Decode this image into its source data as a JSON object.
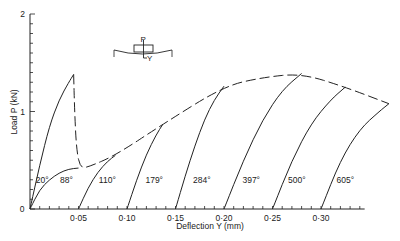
{
  "chart_data": {
    "type": "line",
    "title": "",
    "xlabel": "Deflection Y (mm)",
    "ylabel": "Load P (kN)",
    "xlim": [
      0,
      0.37
    ],
    "ylim": [
      0,
      2
    ],
    "x_ticks": [
      "0",
      "0·05",
      "0·10",
      "0·15",
      "0·20",
      "0·25",
      "0·30"
    ],
    "x_tick_values": [
      0,
      0.05,
      0.1,
      0.15,
      0.2,
      0.25,
      0.3
    ],
    "y_ticks": [
      "0",
      "1",
      "2"
    ],
    "y_tick_values": [
      0,
      1,
      2
    ],
    "grid": false,
    "legend": "none",
    "inset_diagram": {
      "labels": [
        "P",
        "Y"
      ],
      "description": "simply supported beam with central load P and deflection Y"
    },
    "series": [
      {
        "name": "20°",
        "style": "solid",
        "x": [
          0,
          0.01,
          0.02,
          0.03,
          0.04,
          0.045
        ],
        "y": [
          0,
          0.45,
          0.85,
          1.12,
          1.3,
          1.38
        ]
      },
      {
        "name": "88°",
        "style": "solid",
        "x": [
          0,
          0.01,
          0.02,
          0.03,
          0.04,
          0.05
        ],
        "y": [
          0,
          0.2,
          0.3,
          0.37,
          0.41,
          0.42
        ]
      },
      {
        "name": "110°",
        "style": "solid",
        "x": [
          0.05,
          0.06,
          0.07,
          0.08,
          0.088
        ],
        "y": [
          0,
          0.22,
          0.38,
          0.49,
          0.55
        ]
      },
      {
        "name": "179°",
        "style": "solid",
        "x": [
          0.1,
          0.11,
          0.12,
          0.13,
          0.137
        ],
        "y": [
          0,
          0.3,
          0.56,
          0.76,
          0.87
        ]
      },
      {
        "name": "284°",
        "style": "solid",
        "x": [
          0.15,
          0.16,
          0.17,
          0.18,
          0.19,
          0.2
        ],
        "y": [
          0,
          0.34,
          0.65,
          0.92,
          1.12,
          1.26
        ]
      },
      {
        "name": "397°",
        "style": "solid",
        "x": [
          0.2,
          0.22,
          0.24,
          0.26,
          0.28
        ],
        "y": [
          0,
          0.5,
          0.92,
          1.22,
          1.39
        ]
      },
      {
        "name": "500°",
        "style": "solid",
        "x": [
          0.25,
          0.27,
          0.29,
          0.31,
          0.325
        ],
        "y": [
          0,
          0.5,
          0.88,
          1.12,
          1.25
        ]
      },
      {
        "name": "605°",
        "style": "solid",
        "x": [
          0.3,
          0.32,
          0.34,
          0.36,
          0.37
        ],
        "y": [
          0,
          0.5,
          0.82,
          1.0,
          1.08
        ]
      },
      {
        "name": "envelope",
        "style": "dashed",
        "x": [
          0.045,
          0.046,
          0.048,
          0.052,
          0.06,
          0.088,
          0.137,
          0.2,
          0.24,
          0.28,
          0.325,
          0.37
        ],
        "y": [
          1.38,
          1.0,
          0.6,
          0.42,
          0.43,
          0.55,
          0.87,
          1.26,
          1.35,
          1.39,
          1.25,
          1.08
        ]
      }
    ],
    "annotations": [
      {
        "text": "20°",
        "x": 0.006,
        "y": 0.27
      },
      {
        "text": "88°",
        "x": 0.031,
        "y": 0.27
      },
      {
        "text": "110°",
        "x": 0.071,
        "y": 0.27
      },
      {
        "text": "179°",
        "x": 0.119,
        "y": 0.27
      },
      {
        "text": "284°",
        "x": 0.168,
        "y": 0.27
      },
      {
        "text": "397°",
        "x": 0.219,
        "y": 0.27
      },
      {
        "text": "500°",
        "x": 0.266,
        "y": 0.27
      },
      {
        "text": "605°",
        "x": 0.316,
        "y": 0.27
      }
    ]
  }
}
